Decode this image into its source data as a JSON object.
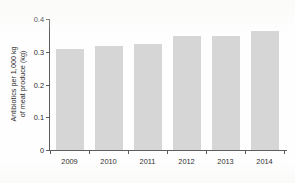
{
  "chart_data": {
    "type": "bar",
    "title": "",
    "subtitle": "",
    "xlabel": "",
    "ylabel": "Antibiotics per 1,000 kg of meat produce (kg)",
    "ylabel_line1": "Antibiotics per 1,000 kg",
    "ylabel_line2": "of meat produce (kg)",
    "categories": [
      "2009",
      "2010",
      "2011",
      "2012",
      "2013",
      "2014"
    ],
    "values": [
      0.307,
      0.318,
      0.324,
      0.347,
      0.348,
      0.363
    ],
    "series": [
      {
        "name": "Antibiotics per 1,000 kg of meat produce",
        "values": [
          0.307,
          0.318,
          0.324,
          0.347,
          0.348,
          0.363
        ]
      }
    ],
    "ylim": [
      0,
      0.4
    ],
    "yticks": [
      0,
      0.1,
      0.2,
      0.3,
      0.4
    ],
    "ytick_labels": [
      "0",
      "0.1",
      "0.2",
      "0.3",
      "0.4"
    ],
    "xtick_labels": [
      "2009",
      "2010",
      "2011",
      "2012",
      "2013",
      "2014"
    ],
    "grid": false,
    "legend": false,
    "legend_position": "none",
    "bar_color": "#d6d6d6",
    "axis_color": "#5d5d5d",
    "text_color": "#2b2b2b",
    "background_color": "#fefefe"
  }
}
